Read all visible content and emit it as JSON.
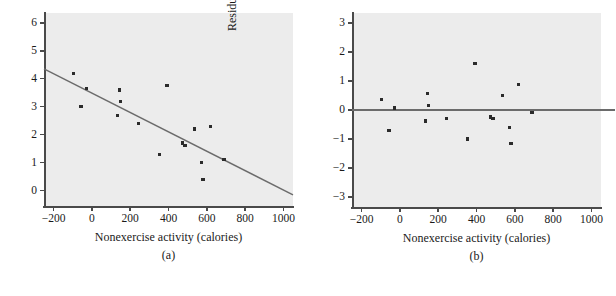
{
  "chart_data": [
    {
      "type": "scatter",
      "panel": "a",
      "caption": "(a)",
      "title": "",
      "xlabel": "Nonexercise activity (calories)",
      "ylabel": "Fat gain (kilograms)",
      "xlim": [
        -250,
        1050
      ],
      "ylim": [
        -0.55,
        6.35
      ],
      "xticks": [
        -200,
        0,
        200,
        400,
        600,
        800,
        1000
      ],
      "xticklabels": [
        "−200",
        "0",
        "200",
        "400",
        "600",
        "800",
        "1000"
      ],
      "yticks": [
        0,
        1,
        2,
        3,
        4,
        5,
        6
      ],
      "yticklabels": [
        "0",
        "1",
        "2",
        "3",
        "4",
        "5",
        "6"
      ],
      "grid": false,
      "legend": null,
      "marker_color": "#2b2b2b",
      "line_color": "#6b6b6b",
      "panel_background": "#ececec",
      "x": [
        -94,
        -57,
        -29,
        135,
        143,
        151,
        245,
        355,
        392,
        473,
        486,
        535,
        571,
        580,
        620,
        690
      ],
      "y": [
        4.2,
        3.0,
        3.65,
        2.7,
        3.6,
        3.2,
        2.4,
        1.3,
        3.75,
        1.7,
        1.6,
        2.2,
        1.0,
        0.4,
        2.3,
        1.1
      ],
      "fit_line": {
        "label": "least-squares regression line",
        "x_endpoints": [
          -250,
          1050
        ],
        "y_endpoints": [
          4.35,
          -0.15
        ],
        "slope": -0.00346,
        "intercept": 3.485
      }
    },
    {
      "type": "scatter",
      "panel": "b",
      "caption": "(b)",
      "title": "",
      "xlabel": "Nonexercise activity (calories)",
      "ylabel": "Residual",
      "xlim": [
        -250,
        1050
      ],
      "ylim": [
        -3.35,
        3.35
      ],
      "xticks": [
        -200,
        0,
        200,
        400,
        600,
        800,
        1000
      ],
      "xticklabels": [
        "−200",
        "0",
        "200",
        "400",
        "600",
        "800",
        "1000"
      ],
      "yticks": [
        -3,
        -2,
        -1,
        0,
        1,
        2,
        3
      ],
      "yticklabels": [
        "−3",
        "−2",
        "−1",
        "0",
        "1",
        "2",
        "3"
      ],
      "grid": false,
      "legend": null,
      "marker_color": "#2b2b2b",
      "line_color": "#6b6b6b",
      "panel_background": "#ececec",
      "x": [
        -94,
        -57,
        -29,
        135,
        143,
        151,
        245,
        355,
        392,
        473,
        486,
        535,
        571,
        580,
        620,
        690
      ],
      "y": [
        0.35,
        -0.72,
        0.07,
        -0.38,
        0.58,
        0.16,
        -0.3,
        -1.0,
        1.61,
        -0.24,
        -0.28,
        0.5,
        -0.6,
        -1.17,
        0.88,
        -0.1
      ],
      "zero_line": {
        "label": "residual zero reference line",
        "y": 0
      }
    }
  ]
}
